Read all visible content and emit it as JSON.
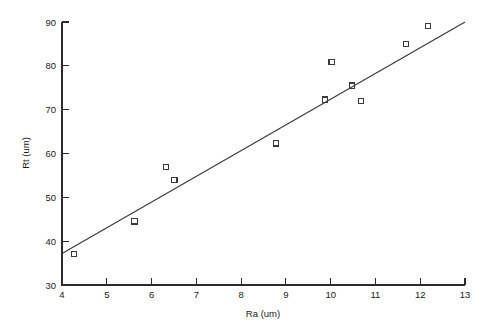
{
  "chart_data": {
    "type": "scatter",
    "title": "",
    "xlabel": "Ra  (um)",
    "ylabel": "Rt  (um)",
    "xlim": [
      4,
      13
    ],
    "ylim": [
      30,
      90
    ],
    "xticks": [
      4,
      5,
      6,
      7,
      8,
      9,
      10,
      11,
      12,
      13
    ],
    "yticks": [
      30,
      40,
      50,
      60,
      70,
      80,
      90
    ],
    "xtick_labels": [
      "4",
      "5",
      "6",
      "7",
      "8",
      "9",
      "10",
      "11",
      "12",
      "13"
    ],
    "ytick_labels": [
      "30",
      "40",
      "50",
      "60",
      "70",
      "80",
      "90"
    ],
    "grid": false,
    "legend": false,
    "marker_style": "open-square",
    "series": [
      {
        "name": "measurements",
        "x": [
          4.27,
          5.62,
          6.33,
          6.51,
          8.78,
          9.87,
          10.02,
          10.47,
          10.67,
          11.69,
          12.18
        ],
        "y": [
          37.0,
          44.5,
          57.0,
          53.9,
          62.3,
          72.3,
          80.9,
          75.5,
          72.0,
          85.0,
          89.1
        ]
      }
    ],
    "fit_line": {
      "name": "linear fit",
      "x": [
        4.02,
        13.0
      ],
      "y": [
        37.3,
        90.0
      ]
    },
    "axis_color": "#2b2b2b",
    "marker_color": "#3a3a3a",
    "line_color": "#3a3a3a",
    "background_color": "#ffffff"
  }
}
